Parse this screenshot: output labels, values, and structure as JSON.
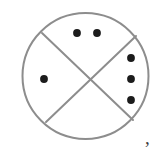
{
  "figure": {
    "type": "geometric-diagram",
    "canvas": {
      "width": 165,
      "height": 151,
      "background": "#ffffff"
    },
    "circle": {
      "cx": 85.5,
      "cy": 76,
      "r": 63,
      "stroke": "#8d8d8d",
      "stroke_width": 2,
      "fill": "none"
    },
    "chords": [
      {
        "name": "diagonal-chord-nw-se",
        "x1": 42,
        "y1": 33,
        "x2": 133,
        "y2": 120,
        "stroke": "#8d8d8d",
        "stroke_width": 2
      },
      {
        "name": "diagonal-chord-ne-sw",
        "x1": 136,
        "y1": 36,
        "x2": 46,
        "y2": 122,
        "stroke": "#8d8d8d",
        "stroke_width": 2
      }
    ],
    "intersection": {
      "x": 87,
      "y": 78
    },
    "dot_style": {
      "radius": 3.9,
      "fill": "#1c1c1c"
    },
    "dot_groups": [
      {
        "name": "top-sector-dots",
        "count": 2,
        "dots": [
          {
            "cx": 77,
            "cy": 33
          },
          {
            "cx": 97,
            "cy": 33
          }
        ]
      },
      {
        "name": "right-sector-dots",
        "count": 3,
        "dots": [
          {
            "cx": 131,
            "cy": 58
          },
          {
            "cx": 131,
            "cy": 79
          },
          {
            "cx": 131,
            "cy": 100
          }
        ]
      },
      {
        "name": "left-sector-dots",
        "count": 1,
        "dots": [
          {
            "cx": 44,
            "cy": 79
          }
        ]
      },
      {
        "name": "bottom-sector-dots",
        "count": 0,
        "dots": []
      }
    ],
    "total_dots": 6,
    "annotation": {
      "name": "trailing-comma",
      "text": ",",
      "x": 145,
      "y": 128,
      "color": "#3a3a3a"
    }
  }
}
